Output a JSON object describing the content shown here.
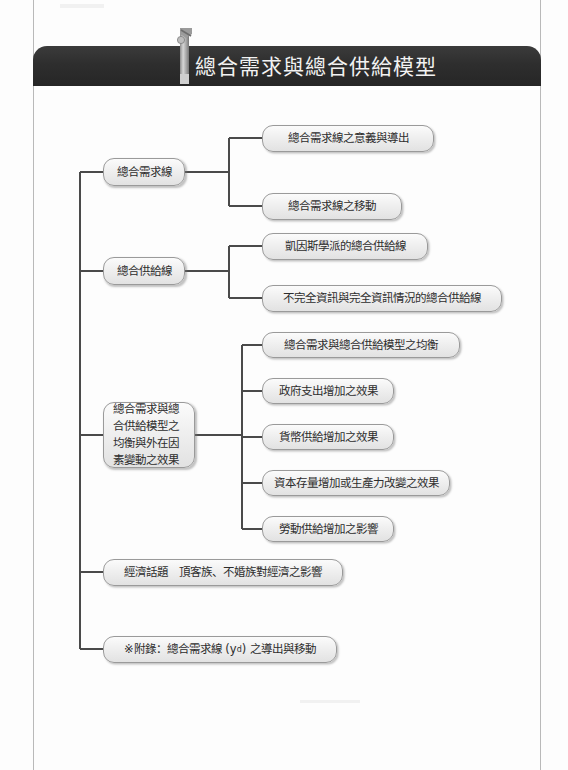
{
  "page": {
    "title": "總合需求與總合供給模型",
    "header_icon": "bookmark-figure-icon"
  },
  "colors": {
    "header_background": "#2e2e2e",
    "header_text": "#f2f2f2",
    "node_border": "#9a9a9a",
    "node_fill": "#f0f0f0",
    "connector": "#4a4a4a",
    "page_rule": "#b9b9b9"
  },
  "diagram": {
    "type": "outline-tree",
    "branches": [
      {
        "id": "branch-aggregate-demand",
        "label": "總合需求線",
        "children": [
          {
            "id": "ad-meaning",
            "label": "總合需求線之意義與導出"
          },
          {
            "id": "ad-shift",
            "label": "總合需求線之移動"
          }
        ]
      },
      {
        "id": "branch-aggregate-supply",
        "label": "總合供給線",
        "children": [
          {
            "id": "as-keynesian",
            "label": "凱因斯學派的總合供給線"
          },
          {
            "id": "as-information",
            "label": "不完全資訊與完全資訊情況的總合供給線"
          }
        ]
      },
      {
        "id": "branch-equilibrium",
        "label": "總合需求與總合供給模型之均衡與外在因素變動之效果",
        "children": [
          {
            "id": "eq-equilibrium",
            "label": "總合需求與總合供給模型之均衡"
          },
          {
            "id": "eq-gov-spending",
            "label": "政府支出增加之效果"
          },
          {
            "id": "eq-money-supply",
            "label": "貨幣供給增加之效果"
          },
          {
            "id": "eq-capital",
            "label": "資本存量增加或生產力改變之效果"
          },
          {
            "id": "eq-labor-supply",
            "label": "勞動供給增加之影響"
          }
        ]
      },
      {
        "id": "branch-economic-topic",
        "label_prefix": "經濟話題",
        "label_suffix": "頂客族、不婚族對經濟之影響",
        "children": []
      },
      {
        "id": "branch-appendix",
        "marker": "※",
        "label_prefix": "附錄：總合需求線 (y",
        "label_sup": "d",
        "label_suffix": ") 之導出與移動",
        "children": []
      }
    ]
  }
}
